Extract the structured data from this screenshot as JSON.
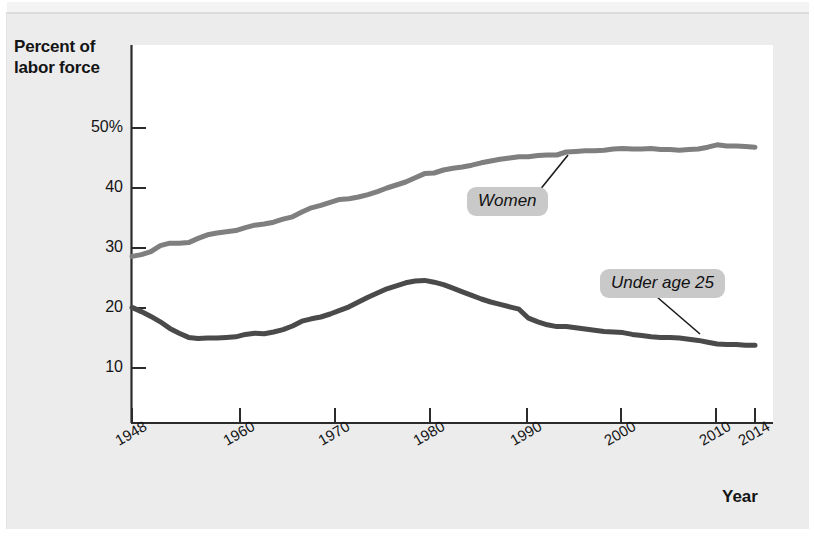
{
  "figure": {
    "background_color": "#ececed",
    "plot_background_color": "#ffffff"
  },
  "chart_data": {
    "type": "line",
    "title": "",
    "subtitle": "",
    "xlabel": "Year",
    "ylabel": "Percent of labor force",
    "xlim": [
      1948,
      2014
    ],
    "ylim": [
      0,
      53
    ],
    "grid": false,
    "legend_position": "inline-callouts",
    "x_tick_labels": [
      "1948",
      "1960",
      "1970",
      "1980",
      "1990",
      "2000",
      "2010",
      "2014"
    ],
    "x_ticks": [
      1948,
      1960,
      1970,
      1980,
      1990,
      2000,
      2010,
      2014
    ],
    "y_tick_labels": [
      "50%",
      "40",
      "30",
      "20",
      "10"
    ],
    "y_ticks": [
      50,
      40,
      30,
      20,
      10
    ],
    "annotations": [
      {
        "text": "Women",
        "series": "Women",
        "anchor_year": 1981,
        "anchor_value": 43.7
      },
      {
        "text": "Under age 25",
        "series": "Under age 25",
        "anchor_year": 2003,
        "anchor_value": 15.8
      }
    ],
    "series": [
      {
        "name": "Women",
        "color": "#7f7f7f",
        "x": [
          1948,
          1949,
          1950,
          1951,
          1952,
          1953,
          1954,
          1955,
          1956,
          1957,
          1958,
          1959,
          1960,
          1961,
          1962,
          1963,
          1964,
          1965,
          1966,
          1967,
          1968,
          1969,
          1970,
          1971,
          1972,
          1973,
          1974,
          1975,
          1976,
          1977,
          1978,
          1979,
          1980,
          1981,
          1982,
          1983,
          1984,
          1985,
          1986,
          1987,
          1988,
          1989,
          1990,
          1991,
          1992,
          1993,
          1994,
          1995,
          1996,
          1997,
          1998,
          1999,
          2000,
          2001,
          2002,
          2003,
          2004,
          2005,
          2006,
          2007,
          2008,
          2009,
          2010,
          2011,
          2012,
          2013,
          2014
        ],
        "values": [
          28.6,
          28.9,
          29.4,
          30.4,
          30.8,
          30.8,
          30.9,
          31.6,
          32.2,
          32.5,
          32.7,
          32.9,
          33.4,
          33.8,
          34.0,
          34.3,
          34.8,
          35.2,
          36.0,
          36.7,
          37.1,
          37.6,
          38.1,
          38.2,
          38.5,
          38.9,
          39.4,
          40.0,
          40.5,
          41.0,
          41.7,
          42.4,
          42.5,
          43.0,
          43.3,
          43.5,
          43.8,
          44.2,
          44.5,
          44.8,
          45.0,
          45.2,
          45.2,
          45.4,
          45.5,
          45.5,
          46.0,
          46.1,
          46.2,
          46.2,
          46.3,
          46.5,
          46.6,
          46.5,
          46.5,
          46.6,
          46.4,
          46.4,
          46.3,
          46.4,
          46.5,
          46.8,
          47.2,
          47.0,
          47.0,
          46.9,
          46.8
        ]
      },
      {
        "name": "Under age 25",
        "color": "#4a4a4a",
        "x": [
          1948,
          1949,
          1950,
          1951,
          1952,
          1953,
          1954,
          1955,
          1956,
          1957,
          1958,
          1959,
          1960,
          1961,
          1962,
          1963,
          1964,
          1965,
          1966,
          1967,
          1968,
          1969,
          1970,
          1971,
          1972,
          1973,
          1974,
          1975,
          1976,
          1977,
          1978,
          1979,
          1980,
          1981,
          1982,
          1983,
          1984,
          1985,
          1986,
          1987,
          1988,
          1989,
          1990,
          1991,
          1992,
          1993,
          1994,
          1995,
          1996,
          1997,
          1998,
          1999,
          2000,
          2001,
          2002,
          2003,
          2004,
          2005,
          2006,
          2007,
          2008,
          2009,
          2010,
          2011,
          2012,
          2013,
          2014
        ],
        "values": [
          20.1,
          19.4,
          18.6,
          17.7,
          16.6,
          15.8,
          15.1,
          14.9,
          15.0,
          15.0,
          15.1,
          15.2,
          15.6,
          15.8,
          15.7,
          16.0,
          16.4,
          17.0,
          17.8,
          18.2,
          18.5,
          19.0,
          19.6,
          20.2,
          21.0,
          21.8,
          22.5,
          23.2,
          23.7,
          24.2,
          24.5,
          24.6,
          24.3,
          23.9,
          23.3,
          22.7,
          22.1,
          21.5,
          21.0,
          20.6,
          20.2,
          19.8,
          18.3,
          17.7,
          17.2,
          16.9,
          16.9,
          16.7,
          16.5,
          16.3,
          16.1,
          16.0,
          15.9,
          15.6,
          15.4,
          15.2,
          15.1,
          15.1,
          15.0,
          14.8,
          14.6,
          14.3,
          14.0,
          13.9,
          13.9,
          13.8,
          13.8
        ]
      }
    ]
  }
}
